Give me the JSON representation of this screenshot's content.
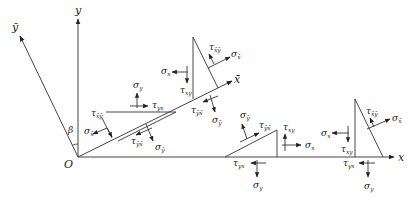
{
  "diagram": {
    "origin_label": "O",
    "axes": {
      "x": "x",
      "y": "y",
      "x_bar": "x̄",
      "y_bar": "ȳ",
      "angle": "β"
    },
    "elements": [
      {
        "id": "lower-left-wedge",
        "labels": {
          "tau_xbar_ybar": "τ",
          "tau_xbar_ybar_sub": "x̄ȳ",
          "sigma_xbar": "σ",
          "sigma_xbar_sub": "x̄",
          "sigma_y": "σ",
          "sigma_y_sub": "y",
          "tau_yx": "τ",
          "tau_yx_sub": "yx",
          "tau_ybar_xbar": "τ",
          "tau_ybar_xbar_sub": "ȳx̄",
          "sigma_ybar": "σ",
          "sigma_ybar_sub": "ȳ"
        }
      },
      {
        "id": "upper-wedge",
        "labels": {
          "tau_xbar_ybar": "τ",
          "tau_xbar_ybar_sub": "x̄ȳ",
          "sigma_xbar": "σ",
          "sigma_xbar_sub": "x̄",
          "sigma_x": "σ",
          "sigma_x_sub": "x",
          "tau_xy": "τ",
          "tau_xy_sub": "xy",
          "tau_ybar_xbar": "τ",
          "tau_ybar_xbar_sub": "ȳx̄",
          "sigma_ybar": "σ",
          "sigma_ybar_sub": "ȳ"
        }
      },
      {
        "id": "lower-right-wedge-1",
        "labels": {
          "sigma_ybar": "σ",
          "sigma_ybar_sub": "ȳ",
          "tau_ybar_xbar": "τ",
          "tau_ybar_xbar_sub": "ȳx̄",
          "tau_xy": "τ",
          "tau_xy_sub": "xy",
          "sigma_x": "σ",
          "sigma_x_sub": "x",
          "tau_yx": "τ",
          "tau_yx_sub": "yx",
          "sigma_y": "σ",
          "sigma_y_sub": "y"
        }
      },
      {
        "id": "lower-right-wedge-2",
        "labels": {
          "sigma_x": "σ",
          "sigma_x_sub": "x",
          "tau_xy": "τ",
          "tau_xy_sub": "xy",
          "tau_xbar_ybar": "τ",
          "tau_xbar_ybar_sub": "x̄ȳ",
          "sigma_xbar": "σ",
          "sigma_xbar_sub": "x̄",
          "tau_yx": "τ",
          "tau_yx_sub": "yx",
          "sigma_y": "σ",
          "sigma_y_sub": "y"
        }
      }
    ]
  }
}
